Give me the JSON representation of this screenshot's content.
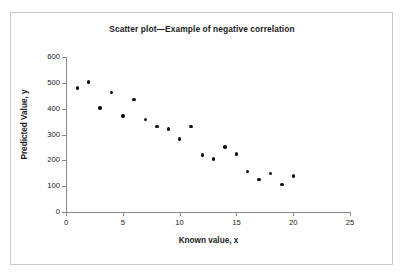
{
  "chart_data": {
    "type": "scatter",
    "title": "Scatter plot—Example of negative correlation",
    "xlabel": "Known value, x",
    "ylabel": "Predicted Value, y",
    "xlim": [
      0,
      25
    ],
    "ylim": [
      0,
      600
    ],
    "xticks": [
      0,
      5,
      10,
      15,
      20,
      25
    ],
    "yticks": [
      0,
      100,
      200,
      300,
      400,
      500,
      600
    ],
    "grid": false,
    "legend": null,
    "marker": "filled-diamond",
    "marker_color": "#111111",
    "series": [
      {
        "name": "Predicted vs Known",
        "x": [
          1,
          2,
          3,
          4,
          5,
          6,
          7,
          8,
          9,
          10,
          11,
          12,
          13,
          14,
          15,
          16,
          17,
          18,
          19,
          20
        ],
        "y": [
          480,
          503,
          403,
          462,
          372,
          435,
          358,
          331,
          322,
          282,
          332,
          221,
          205,
          252,
          225,
          156,
          127,
          150,
          106,
          139
        ]
      }
    ]
  },
  "axes": {
    "yticklabels": [
      "600",
      "500",
      "400",
      "300",
      "200",
      "100",
      "0"
    ],
    "xticklabels": [
      "0",
      "5",
      "10",
      "15",
      "20",
      "25"
    ]
  },
  "colors": {
    "marker": "#111111",
    "axis": "#8a8a8a",
    "frame": "#c9c9c9",
    "text": "#1a1a1a",
    "background": "#ffffff"
  }
}
